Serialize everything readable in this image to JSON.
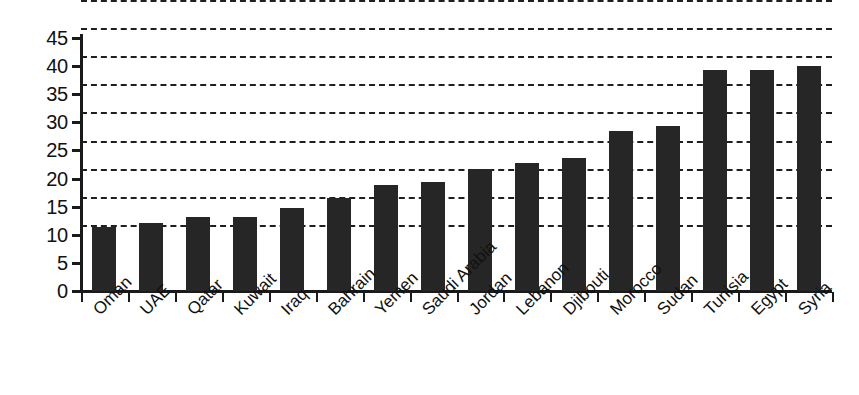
{
  "chart_data": {
    "type": "bar",
    "title": "",
    "subtitle": "",
    "xlabel": "",
    "ylabel": "",
    "categories": [
      "Oman",
      "UAE",
      "Qatar",
      "Kuwait",
      "Iraq",
      "Bahrain",
      "Yemen",
      "Saudi Arabia",
      "Jordan",
      "Lebanon",
      "Djibouti",
      "Morocco",
      "Sudan",
      "Tunisia",
      "Egypt",
      "Syria"
    ],
    "values": [
      11.3,
      12.1,
      13.1,
      13.1,
      14.8,
      16.6,
      18.9,
      19.4,
      21.7,
      22.7,
      23.6,
      28.4,
      29.4,
      39.3,
      39.4,
      40.1
    ],
    "ylim": [
      0,
      45
    ],
    "ytick_labels": [
      "45",
      "40",
      "35",
      "30",
      "25",
      "20",
      "15",
      "10",
      "5",
      "0"
    ],
    "ytick_values": [
      45,
      40,
      35,
      30,
      25,
      20,
      15,
      10,
      5,
      0
    ],
    "grid": true,
    "grid_style": "dashed-horizontal",
    "legend": "none",
    "bar_color": "#262626",
    "axis_color": "#1a1a1a",
    "background": "#ffffff",
    "annotations": []
  }
}
